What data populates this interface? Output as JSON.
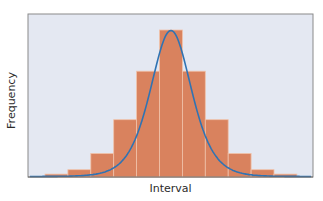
{
  "chart_data": {
    "type": "bar",
    "subtype": "histogram-with-normal-curve",
    "title": "",
    "xlabel": "Interval",
    "ylabel": "Frequency",
    "categories": [
      "1",
      "2",
      "3",
      "4",
      "5",
      "6",
      "7",
      "8",
      "9",
      "10",
      "11"
    ],
    "values": [
      2,
      5,
      16,
      39,
      72,
      100,
      72,
      39,
      16,
      5,
      2
    ],
    "ylim": [
      0,
      100
    ],
    "grid": false,
    "legend": null,
    "series": [
      {
        "name": "Frequency",
        "type": "bar",
        "values": [
          2,
          5,
          16,
          39,
          72,
          100,
          72,
          39,
          16,
          5,
          2
        ]
      },
      {
        "name": "Normal curve",
        "type": "line",
        "shape": "bell"
      }
    ],
    "colors": {
      "background": "#e4e8f2",
      "bar": "#d9825e",
      "bar_separator": "#f0c2aa",
      "curve": "#2f73b3",
      "frame": "#8a8a8a"
    }
  }
}
